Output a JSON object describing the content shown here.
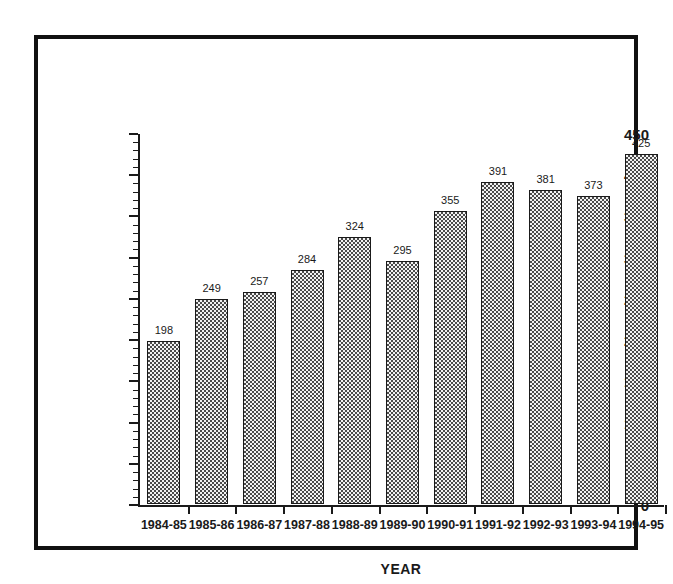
{
  "chart_data": {
    "type": "bar",
    "title": "",
    "xlabel": "YEAR",
    "ylabel": "",
    "ylim": [
      0,
      450
    ],
    "ytick_step": 50,
    "yminor_step": 10,
    "grid": false,
    "legend": null,
    "categories": [
      "1984-85",
      "1985-86",
      "1986-87",
      "1987-88",
      "1988-89",
      "1989-90",
      "1990-91",
      "1991-92",
      "1992-93",
      "1993-94",
      "1994-95"
    ],
    "values": [
      198,
      249,
      257,
      284,
      324,
      295,
      355,
      391,
      381,
      373,
      425
    ],
    "ytick_labels": [
      "0",
      "50",
      "100",
      "150",
      "200",
      "250",
      "300",
      "350",
      "400",
      "450"
    ],
    "ytick_values": [
      0,
      50,
      100,
      150,
      200,
      250,
      300,
      350,
      400,
      450
    ],
    "bar_labels": [
      "198",
      "249",
      "257",
      "284",
      "324",
      "295",
      "355",
      "391",
      "381",
      "373",
      "425"
    ],
    "colors": {
      "bar_fill": "#f2f2f2",
      "bar_pattern": "#4a4a4a",
      "bar_border": "#1a1a1a",
      "axis": "#1a1a1a",
      "text": "#1a1a1a",
      "frame": "#111111",
      "background": "#ffffff"
    }
  },
  "figure": {
    "frame_style": "thick-black-rectangle"
  }
}
